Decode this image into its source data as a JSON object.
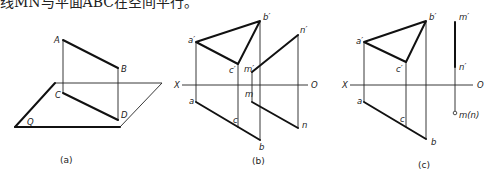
{
  "caption_top": "线MN与平面ABC在空间平行。",
  "panels": {
    "a": {
      "caption": "(a)",
      "labels": {
        "A": "A",
        "B": "B",
        "C": "C",
        "D": "D",
        "Q": "Q"
      }
    },
    "b": {
      "caption": "(b)",
      "labels": {
        "a_p": "a′",
        "b_p": "b′",
        "c_p": "c′",
        "m_p": "m′",
        "n_p": "n′",
        "X": "X",
        "O": "O",
        "a": "a",
        "b": "b",
        "c": "c",
        "m": "m",
        "n": "n"
      }
    },
    "c": {
      "caption": "(c)",
      "labels": {
        "a_p": "a′",
        "b_p": "b′",
        "c_p": "c′",
        "m_p": "m′",
        "n_p": "n′",
        "X": "X",
        "O": "O",
        "a": "a",
        "b": "b",
        "c": "c",
        "mn": "m(n)"
      }
    }
  }
}
